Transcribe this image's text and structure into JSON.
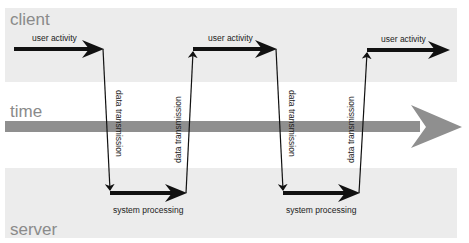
{
  "diagram": {
    "lanes": {
      "client": {
        "label": "client",
        "color": "#ececec"
      },
      "time": {
        "label": "time",
        "color": "#8f8f8f"
      },
      "server": {
        "label": "server",
        "color": "#ececec"
      }
    },
    "flow": {
      "user_activity": [
        "user activity",
        "user activity",
        "user activity"
      ],
      "data_transmission": [
        "data transmission",
        "data transmission",
        "data transmission",
        "data transmission"
      ],
      "system_processing": [
        "system processing",
        "system processing"
      ]
    },
    "colors": {
      "arrow": "#111111",
      "time_arrow": "#8f8f8f",
      "band": "#ececec",
      "label": "#8a8a8a"
    }
  }
}
